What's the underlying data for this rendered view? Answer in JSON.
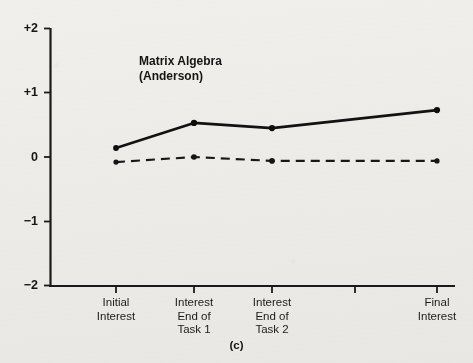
{
  "figure": {
    "caption": "(c)",
    "background_color": "#f1efeb",
    "ink_color": "#161616"
  },
  "chart_data": {
    "type": "line",
    "title": "Matrix Algebra\n(Anderson)",
    "title_line1": "Matrix Algebra",
    "title_line2": "(Anderson)",
    "xlabel": "",
    "ylabel": "",
    "ylim": [
      -2,
      2
    ],
    "yticks": [
      2,
      1,
      0,
      -1,
      -2
    ],
    "ytick_labels": [
      "+2",
      "+1",
      "0",
      "−1",
      "−2"
    ],
    "grid": false,
    "legend": "none",
    "categories": [
      "Initial\nInterest",
      "Interest\nEnd of\nTask 1",
      "Interest\nEnd of\nTask 2",
      "",
      "Final\nInterest"
    ],
    "category_labels": [
      {
        "line1": "Initial",
        "line2": "Interest",
        "line3": ""
      },
      {
        "line1": "Interest",
        "line2": "End of",
        "line3": "Task 1"
      },
      {
        "line1": "Interest",
        "line2": "End of",
        "line3": "Task 2"
      },
      {
        "line1": "",
        "line2": "",
        "line3": ""
      },
      {
        "line1": "Final",
        "line2": "Interest",
        "line3": ""
      }
    ],
    "x_positions": [
      116,
      194,
      272,
      355,
      437
    ],
    "series": [
      {
        "name": "solid",
        "style": "solid",
        "marker": "filled-circle",
        "x": [
          116,
          194,
          272,
          437
        ],
        "values": [
          0.14,
          0.53,
          0.45,
          0.73
        ]
      },
      {
        "name": "dashed",
        "style": "dashed",
        "marker": "filled-circle",
        "x": [
          116,
          194,
          272,
          437
        ],
        "values": [
          -0.08,
          0.0,
          -0.06,
          -0.06
        ]
      }
    ]
  },
  "axes": {
    "y_tick_0": "+2",
    "y_tick_1": "+1",
    "y_tick_2": "0",
    "y_tick_3": "−1",
    "y_tick_4": "−2"
  },
  "xtick_labels": {
    "t0": "Initial\nInterest",
    "t1": "Interest\nEnd of\nTask 1",
    "t2": "Interest\nEnd of\nTask 2",
    "t3": "",
    "t4": "Final\nInterest"
  }
}
